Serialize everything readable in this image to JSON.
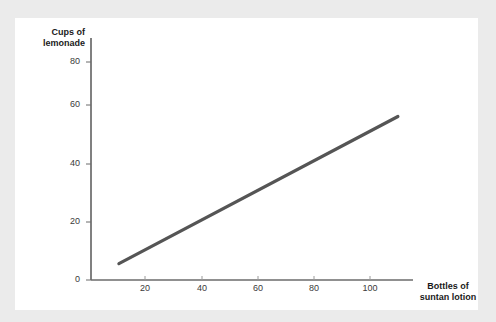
{
  "chart_data": {
    "type": "line",
    "title": "",
    "xlabel": "Bottles of suntan lotion",
    "ylabel": "Cups of lemonade",
    "xlim": [
      0,
      116
    ],
    "ylim": [
      0,
      86
    ],
    "grid": false,
    "legend": "none",
    "xticks": [
      20,
      40,
      60,
      80,
      100
    ],
    "yticks": [
      0,
      20,
      40,
      60,
      80
    ],
    "xtick_labels": [
      "20",
      "40",
      "60",
      "80",
      "100"
    ],
    "ytick_labels": [
      "0",
      "20",
      "40",
      "60",
      "80"
    ],
    "series": [
      {
        "name": "lemonade vs suntan lotion",
        "color": "#555555",
        "x": [
          10,
          110
        ],
        "values": [
          6,
          60
        ]
      }
    ],
    "annotations": []
  },
  "axis_titles": {
    "y_line1": "Cups of",
    "y_line2": "lemonade",
    "x_line1": "Bottles of",
    "x_line2": "suntan lotion"
  },
  "colors": {
    "page_background": "#ebebeb",
    "card_background": "#ffffff",
    "line": "#555555",
    "axis": "#6b6b6b",
    "tick_text": "#3a3a3a",
    "title_text": "#1a1a1a"
  }
}
